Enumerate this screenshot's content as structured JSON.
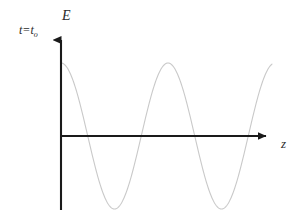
{
  "figure": {
    "background_color": "#ffffff",
    "axis_color": "#1a1a1a",
    "curve_color": "#c9c9c9",
    "text_color": "#2b2b2b"
  },
  "labels": {
    "y_axis": "E",
    "x_axis": "z",
    "time_variable": "t=t",
    "time_subscript": "o"
  },
  "chart_data": {
    "type": "line",
    "title": "",
    "xlabel": "z",
    "ylabel": "E",
    "annotations": [
      "t=t o"
    ],
    "grid": false,
    "legend": null,
    "waveform": "cosine",
    "amplitude": 73,
    "period_px": 107,
    "phase": "peak-at-origin",
    "origin_px": [
      61,
      136
    ],
    "y_axis_top_px": 32,
    "y_axis_bottom_px": 210,
    "x_axis_right_px": 274,
    "curve_start_px": [
      61,
      63
    ],
    "curve_end_px": [
      272,
      92
    ],
    "peaks_px": [
      [
        61,
        63
      ],
      [
        168,
        63
      ]
    ],
    "troughs_px": [
      [
        114,
        195
      ],
      [
        221,
        195
      ]
    ],
    "zero_crossings_px": [
      [
        87,
        136
      ],
      [
        141,
        136
      ],
      [
        194,
        136
      ],
      [
        248,
        136
      ]
    ],
    "xlim": [
      61,
      274
    ],
    "ylim": [
      63,
      195
    ]
  }
}
